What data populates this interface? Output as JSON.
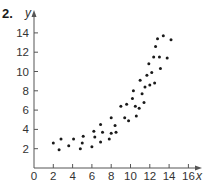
{
  "problem_number": "2.",
  "chart_data": {
    "type": "scatter",
    "title": "",
    "xlabel": "x",
    "ylabel": "y",
    "xlim": [
      0,
      17
    ],
    "ylim": [
      0,
      15
    ],
    "grid": false,
    "legend": null,
    "x_ticks": [
      0,
      2,
      4,
      6,
      8,
      10,
      12,
      14,
      16
    ],
    "y_ticks": [
      2,
      4,
      6,
      8,
      10,
      12,
      14
    ],
    "x_tick_labels": [
      "0",
      "2",
      "4",
      "6",
      "8",
      "10",
      "12",
      "14",
      "16"
    ],
    "y_tick_labels": [
      "2",
      "4",
      "6",
      "8",
      "10",
      "12",
      "14"
    ],
    "points": [
      {
        "x": 2.0,
        "y": 2.6
      },
      {
        "x": 2.6,
        "y": 1.9
      },
      {
        "x": 2.8,
        "y": 3.0
      },
      {
        "x": 3.6,
        "y": 2.3
      },
      {
        "x": 4.1,
        "y": 3.0
      },
      {
        "x": 4.8,
        "y": 2.0
      },
      {
        "x": 5.0,
        "y": 2.6
      },
      {
        "x": 5.1,
        "y": 3.3
      },
      {
        "x": 6.0,
        "y": 2.2
      },
      {
        "x": 6.2,
        "y": 3.8
      },
      {
        "x": 6.3,
        "y": 3.2
      },
      {
        "x": 6.9,
        "y": 2.7
      },
      {
        "x": 6.9,
        "y": 4.5
      },
      {
        "x": 7.1,
        "y": 3.7
      },
      {
        "x": 7.8,
        "y": 3.0
      },
      {
        "x": 8.0,
        "y": 3.6
      },
      {
        "x": 8.0,
        "y": 5.2
      },
      {
        "x": 8.4,
        "y": 4.4
      },
      {
        "x": 8.5,
        "y": 3.7
      },
      {
        "x": 9.0,
        "y": 6.4
      },
      {
        "x": 9.4,
        "y": 5.2
      },
      {
        "x": 9.6,
        "y": 6.6
      },
      {
        "x": 9.8,
        "y": 4.9
      },
      {
        "x": 10.2,
        "y": 7.2
      },
      {
        "x": 10.3,
        "y": 8.0
      },
      {
        "x": 10.5,
        "y": 6.4
      },
      {
        "x": 10.6,
        "y": 5.4
      },
      {
        "x": 10.9,
        "y": 6.2
      },
      {
        "x": 11.2,
        "y": 7.7
      },
      {
        "x": 11.4,
        "y": 6.8
      },
      {
        "x": 11.0,
        "y": 9.1
      },
      {
        "x": 11.5,
        "y": 8.4
      },
      {
        "x": 11.7,
        "y": 9.6
      },
      {
        "x": 11.9,
        "y": 10.8
      },
      {
        "x": 12.0,
        "y": 8.6
      },
      {
        "x": 12.2,
        "y": 9.9
      },
      {
        "x": 12.5,
        "y": 8.8
      },
      {
        "x": 12.4,
        "y": 11.5
      },
      {
        "x": 12.6,
        "y": 12.6
      },
      {
        "x": 13.0,
        "y": 11.5
      },
      {
        "x": 13.1,
        "y": 10.3
      },
      {
        "x": 12.8,
        "y": 13.4
      },
      {
        "x": 13.4,
        "y": 13.7
      },
      {
        "x": 13.8,
        "y": 11.4
      },
      {
        "x": 14.2,
        "y": 13.3
      }
    ]
  },
  "colors": {
    "axis": "#555555",
    "point": "#1a1a1a",
    "text": "#333333"
  }
}
